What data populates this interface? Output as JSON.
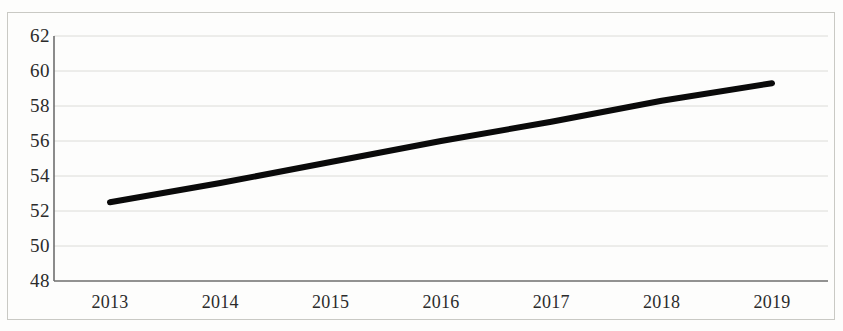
{
  "chart_data": {
    "type": "line",
    "title": "",
    "subtitle": "",
    "xlabel": "",
    "ylabel": "",
    "categories": [
      "2013",
      "2014",
      "2015",
      "2016",
      "2017",
      "2018",
      "2019"
    ],
    "x": [
      2013,
      2014,
      2015,
      2016,
      2017,
      2018,
      2019
    ],
    "series": [
      {
        "name": "",
        "values": [
          52.5,
          53.6,
          54.8,
          56.0,
          57.1,
          58.3,
          59.3
        ],
        "color": "#0a0a0a",
        "line_width": 6,
        "markers": false
      }
    ],
    "ylim": [
      48,
      62
    ],
    "yticks": [
      48,
      50,
      52,
      54,
      56,
      58,
      60,
      62
    ],
    "ytick_labels": [
      "48",
      "50",
      "52",
      "54",
      "56",
      "58",
      "60",
      "62"
    ],
    "xtick_labels": [
      "2013",
      "2014",
      "2015",
      "2016",
      "2017",
      "2018",
      "2019"
    ],
    "grid": {
      "horizontal": true,
      "vertical": false,
      "color": "#dcdcd8"
    },
    "legend": {
      "visible": false,
      "position": "none",
      "entries": []
    },
    "axis": {
      "color": "#6e6e6e",
      "left_spine": true,
      "bottom_spine": true,
      "top_spine": false,
      "right_spine": false
    },
    "plot_area": {
      "left": 54,
      "right": 828,
      "top": 36,
      "bottom": 281
    },
    "background_color": "#fdfdfc",
    "frame_color": "#c9c9c4"
  }
}
